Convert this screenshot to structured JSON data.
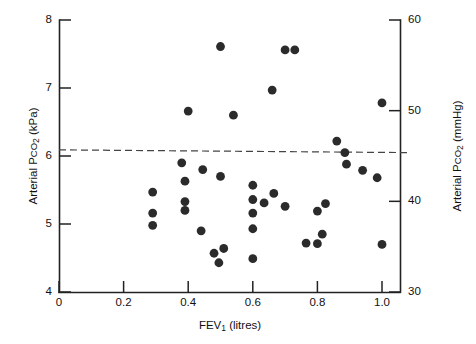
{
  "chart_data": {
    "type": "scatter",
    "title": "",
    "subtitle": "",
    "xlabel": "FEV1 (litres)",
    "ylabel": "Arterial PCO2 (kPa)",
    "ylabel_right": "Arterial PCO2 (mmHg)",
    "xlim": [
      0,
      1.1
    ],
    "ylim": [
      4,
      8
    ],
    "ylim_right": [
      30,
      60
    ],
    "grid": false,
    "legend": null,
    "xticks": [
      0,
      0.2,
      0.4,
      0.6,
      0.8,
      1.0
    ],
    "xticklabels": [
      "0",
      "0.2",
      "0.4",
      "0.6",
      "0.8",
      "1.0"
    ],
    "yticks": [
      4,
      5,
      6,
      7,
      8
    ],
    "yticklabels": [
      "4",
      "5",
      "6",
      "7",
      "8"
    ],
    "yticks_right": [
      30,
      40,
      50,
      60
    ],
    "yticklabels_right": [
      "30",
      "40",
      "50",
      "60"
    ],
    "annotations": [
      {
        "name": "reference-line",
        "kind": "dashed-horizontal-line",
        "y_start": 6.09,
        "y_end": 6.05,
        "x_start": 0.0,
        "x_end": 1.08
      }
    ],
    "series": [
      {
        "name": "patients",
        "marker": "filled-circle",
        "color": "#2b2b2b",
        "points": [
          {
            "x": 0.29,
            "y": 5.47
          },
          {
            "x": 0.29,
            "y": 5.16
          },
          {
            "x": 0.29,
            "y": 4.98
          },
          {
            "x": 0.38,
            "y": 5.9
          },
          {
            "x": 0.39,
            "y": 5.63
          },
          {
            "x": 0.39,
            "y": 5.33
          },
          {
            "x": 0.39,
            "y": 5.2
          },
          {
            "x": 0.4,
            "y": 6.66
          },
          {
            "x": 0.445,
            "y": 5.8
          },
          {
            "x": 0.44,
            "y": 4.9
          },
          {
            "x": 0.5,
            "y": 7.61
          },
          {
            "x": 0.5,
            "y": 5.7
          },
          {
            "x": 0.48,
            "y": 4.57
          },
          {
            "x": 0.51,
            "y": 4.64
          },
          {
            "x": 0.495,
            "y": 4.43
          },
          {
            "x": 0.54,
            "y": 6.6
          },
          {
            "x": 0.6,
            "y": 5.57
          },
          {
            "x": 0.6,
            "y": 5.36
          },
          {
            "x": 0.6,
            "y": 5.16
          },
          {
            "x": 0.6,
            "y": 4.93
          },
          {
            "x": 0.6,
            "y": 4.49
          },
          {
            "x": 0.635,
            "y": 5.31
          },
          {
            "x": 0.66,
            "y": 6.97
          },
          {
            "x": 0.665,
            "y": 5.45
          },
          {
            "x": 0.7,
            "y": 5.26
          },
          {
            "x": 0.7,
            "y": 7.56
          },
          {
            "x": 0.73,
            "y": 7.56
          },
          {
            "x": 0.765,
            "y": 4.72
          },
          {
            "x": 0.8,
            "y": 4.71
          },
          {
            "x": 0.8,
            "y": 5.19
          },
          {
            "x": 0.815,
            "y": 4.85
          },
          {
            "x": 0.825,
            "y": 5.3
          },
          {
            "x": 0.86,
            "y": 6.22
          },
          {
            "x": 0.885,
            "y": 6.05
          },
          {
            "x": 0.89,
            "y": 5.88
          },
          {
            "x": 0.94,
            "y": 5.79
          },
          {
            "x": 0.985,
            "y": 5.68
          },
          {
            "x": 1.0,
            "y": 6.78
          },
          {
            "x": 1.0,
            "y": 4.7
          }
        ]
      }
    ]
  },
  "axes": {
    "left_title_parts": {
      "pre": "Arterial P",
      "sc": "CO",
      "sub": "2",
      "post": " (kPa)"
    },
    "right_title_parts": {
      "pre": "Arterial P",
      "sc": "CO",
      "sub": "2",
      "post": " (mmHg)"
    },
    "bottom_title_parts": {
      "pre": "FEV",
      "sub": "1",
      "post": " (litres)"
    }
  }
}
